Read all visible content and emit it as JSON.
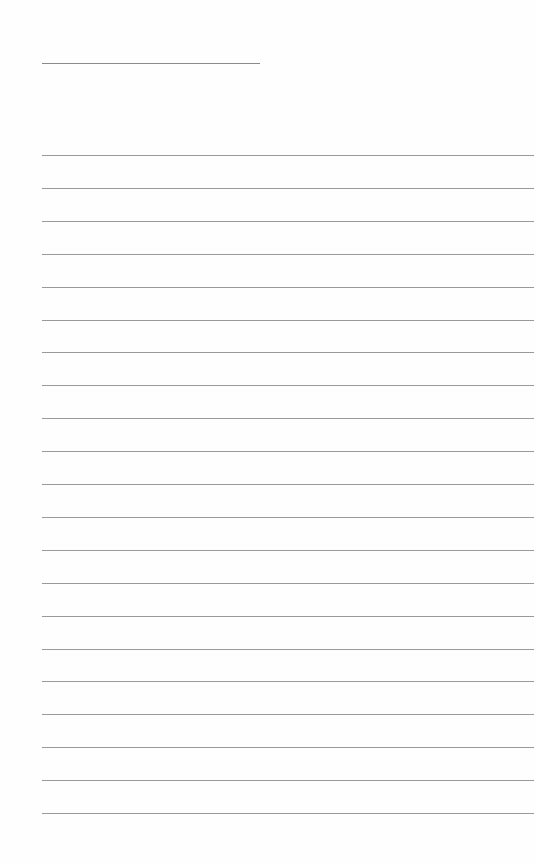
{
  "page": {
    "type": "blank lined paper",
    "title_line": {
      "x": 42,
      "y": 63,
      "width": 218
    },
    "rules": {
      "count": 21,
      "start_y": 155,
      "spacing": 32.9,
      "left": 42,
      "right": 534,
      "color": "#9a9a9a"
    },
    "background": "#ffffff"
  }
}
